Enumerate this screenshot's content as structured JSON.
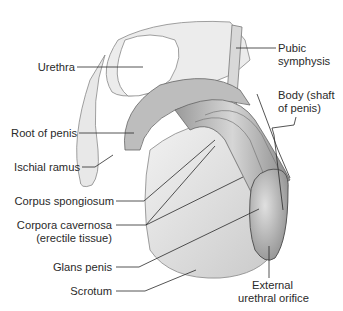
{
  "diagram": {
    "labels": {
      "urethra": "Urethra",
      "pubic_symphysis_1": "Pubic",
      "pubic_symphysis_2": "symphysis",
      "body_1": "Body (shaft",
      "body_2": "of penis)",
      "root": "Root of penis",
      "ischial_ramus": "Ischial ramus",
      "corpus_spongiosum": "Corpus spongiosum",
      "corpora_cavernosa_1": "Corpora cavernosa",
      "corpora_cavernosa_2": "(erectile tissue)",
      "glans": "Glans penis",
      "scrotum": "Scrotum",
      "external_orifice_1": "External",
      "external_orifice_2": "urethral orifice"
    }
  }
}
